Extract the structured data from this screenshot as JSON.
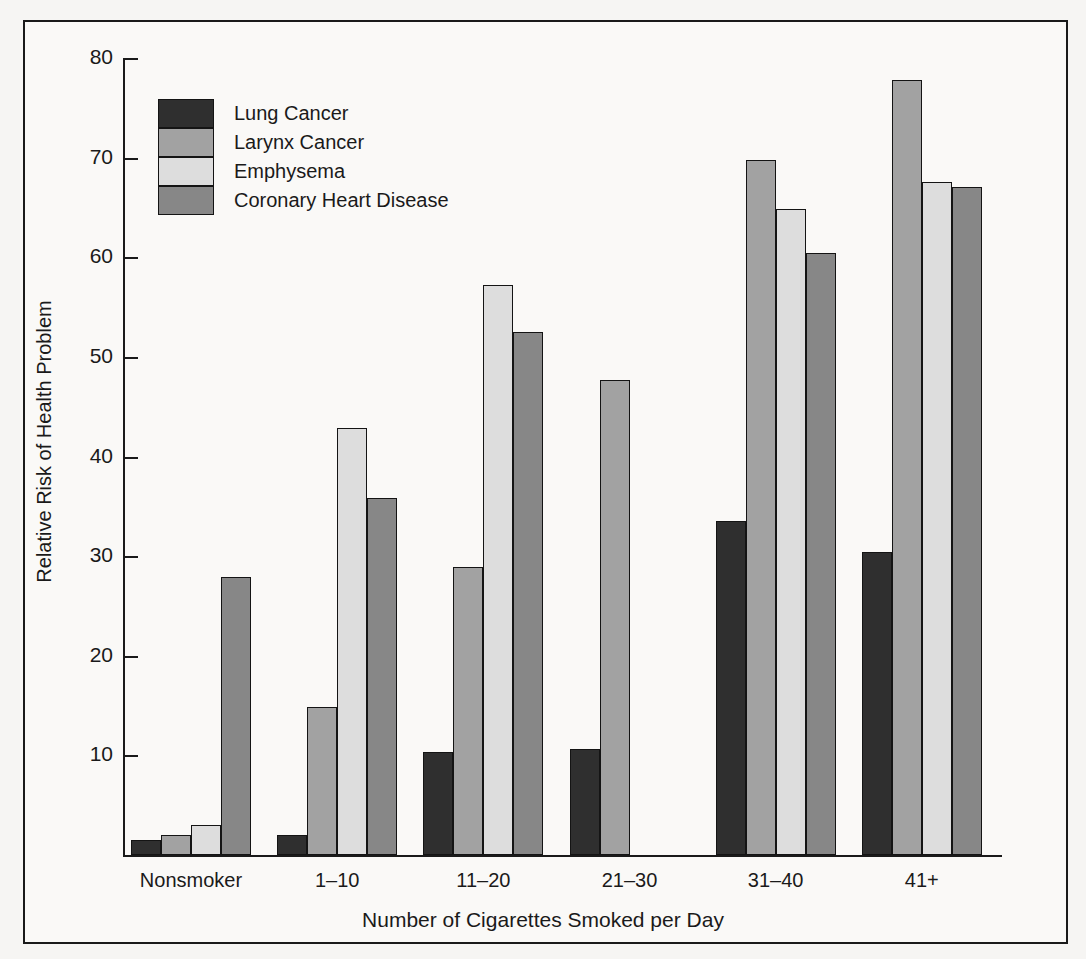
{
  "chart_data": {
    "type": "bar",
    "title": "",
    "xlabel": "Number of Cigarettes Smoked per Day",
    "ylabel": "Relative Risk of Health Problem",
    "categories": [
      "Nonsmoker",
      "1–10",
      "11–20",
      "21–30",
      "31–40",
      "41+"
    ],
    "ylim": [
      0,
      80
    ],
    "yticks": [
      10,
      20,
      30,
      40,
      50,
      60,
      70,
      80
    ],
    "ytick_labels": [
      "10",
      "20",
      "30",
      "40",
      "50",
      "60",
      "70",
      "80"
    ],
    "grid": false,
    "legend_position": "upper-left-inside",
    "series": [
      {
        "name": "Lung Cancer",
        "color": "#2f2f2f",
        "values": [
          1.5,
          2.0,
          10.3,
          10.6,
          33.5,
          30.4
        ]
      },
      {
        "name": "Larynx Cancer",
        "color": "#a2a2a2",
        "values": [
          2.0,
          14.9,
          28.9,
          47.7,
          69.8,
          77.8
        ]
      },
      {
        "name": "Emphysema",
        "color": "#dddddd",
        "values": [
          3.0,
          42.9,
          57.2,
          0,
          64.8,
          67.6
        ]
      },
      {
        "name": "Coronary Heart Disease",
        "color": "#878787",
        "values": [
          27.9,
          35.8,
          52.5,
          0,
          60.4,
          67.1
        ]
      }
    ]
  },
  "colors": {
    "background": "#faf9f7",
    "axis": "#1a1a1a",
    "frame": "#1a1a1a",
    "lung_cancer": "#2f2f2f",
    "larynx_cancer": "#a2a2a2",
    "emphysema": "#dddddd",
    "coronary_heart_disease": "#878787"
  }
}
